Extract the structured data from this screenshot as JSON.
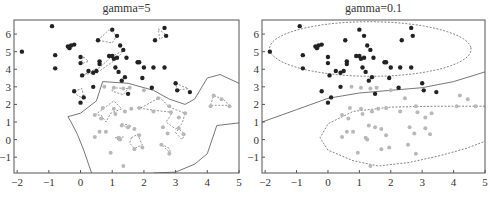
{
  "chart_data": [
    {
      "type": "scatter",
      "title": "gamma=5",
      "xlabel": "",
      "ylabel": "",
      "xlim": [
        -2.1,
        5
      ],
      "ylim": [
        -1.9,
        6.8
      ],
      "xticks": [
        "-2",
        "-1",
        "0",
        "1",
        "2",
        "3",
        "4",
        "5"
      ],
      "yticks": [
        "-1",
        "0",
        "1",
        "2",
        "3",
        "4",
        "5",
        "6"
      ],
      "grid": false,
      "series": [
        {
          "name": "class-dark",
          "color": "#222222",
          "points": [
            [
              -1.85,
              5.0
            ],
            [
              -0.9,
              6.45
            ],
            [
              -0.8,
              4.8
            ],
            [
              -0.8,
              4.05
            ],
            [
              -0.4,
              5.3
            ],
            [
              -0.35,
              5.2
            ],
            [
              -0.3,
              5.35
            ],
            [
              -0.2,
              5.4
            ],
            [
              0,
              4.7
            ],
            [
              0,
              4.35
            ],
            [
              0.05,
              3.65
            ],
            [
              0.25,
              3.9
            ],
            [
              0.4,
              3.8
            ],
            [
              0.5,
              3.9
            ],
            [
              0.55,
              5.65
            ],
            [
              0.6,
              4.45
            ],
            [
              0.6,
              4.3
            ],
            [
              0.9,
              4.75
            ],
            [
              1.0,
              6.25
            ],
            [
              1.0,
              4.75
            ],
            [
              1.05,
              4.6
            ],
            [
              1.1,
              4.1
            ],
            [
              1.15,
              5.9
            ],
            [
              1.15,
              4.65
            ],
            [
              1.2,
              3.85
            ],
            [
              1.25,
              5.35
            ],
            [
              1.3,
              3.35
            ],
            [
              1.35,
              5.1
            ],
            [
              1.4,
              3.55
            ],
            [
              1.45,
              4.65
            ],
            [
              1.5,
              2.6
            ],
            [
              1.8,
              4.4
            ],
            [
              1.85,
              4.4
            ],
            [
              1.95,
              3.5
            ],
            [
              2.0,
              4.1
            ],
            [
              2.25,
              2.95
            ],
            [
              2.3,
              4.1
            ],
            [
              2.35,
              5.65
            ],
            [
              2.65,
              6.35
            ],
            [
              2.7,
              5.9
            ],
            [
              2.65,
              4.1
            ],
            [
              3.0,
              3.2
            ],
            [
              3.05,
              2.8
            ],
            [
              3.45,
              2.7
            ],
            [
              -0.2,
              2.75
            ],
            [
              0,
              2.1
            ],
            [
              0.1,
              2.4
            ],
            [
              0.4,
              3.0
            ]
          ]
        },
        {
          "name": "class-light",
          "color": "#bbbbbb",
          "points": [
            [
              0.75,
              3.0
            ],
            [
              1.05,
              2.95
            ],
            [
              1.35,
              2.9
            ],
            [
              1.55,
              2.95
            ],
            [
              2.0,
              2.8
            ],
            [
              0.45,
              1.4
            ],
            [
              0.7,
              1.8
            ],
            [
              0.65,
              1.2
            ],
            [
              0.6,
              0.45
            ],
            [
              0.8,
              0.45
            ],
            [
              1.05,
              1.75
            ],
            [
              1.1,
              1.45
            ],
            [
              1.4,
              1.6
            ],
            [
              1.6,
              1.75
            ],
            [
              1.85,
              1.8
            ],
            [
              2.3,
              1.6
            ],
            [
              2.45,
              2.35
            ],
            [
              2.8,
              1.9
            ],
            [
              2.85,
              1.55
            ],
            [
              3.1,
              1.25
            ],
            [
              3.3,
              1.5
            ],
            [
              2.6,
              0.7
            ],
            [
              2.75,
              0.35
            ],
            [
              3.1,
              0.65
            ],
            [
              3.25,
              0.3
            ],
            [
              1.3,
              0.8
            ],
            [
              1.5,
              0.7
            ],
            [
              1.7,
              0.6
            ],
            [
              1.2,
              0.1
            ],
            [
              1.25,
              0.0
            ],
            [
              1.85,
              0.25
            ],
            [
              1.95,
              -0.45
            ],
            [
              1.7,
              -0.55
            ],
            [
              2.55,
              -0.3
            ],
            [
              2.8,
              -0.8
            ],
            [
              0.95,
              -0.75
            ],
            [
              1.35,
              -1.5
            ],
            [
              4.2,
              2.5
            ],
            [
              4.45,
              2.3
            ],
            [
              4.7,
              1.9
            ],
            [
              4.1,
              1.9
            ],
            [
              0.45,
              0.15
            ]
          ]
        }
      ],
      "annotations": [
        "decision boundary (solid)",
        "margin contours (dashed)"
      ]
    },
    {
      "type": "scatter",
      "title": "gamma=0.1",
      "xlabel": "",
      "ylabel": "",
      "xlim": [
        -2.1,
        5
      ],
      "ylim": [
        -1.9,
        6.8
      ],
      "xticks": [
        "-2",
        "-1",
        "0",
        "1",
        "2",
        "3",
        "4",
        "5"
      ],
      "yticks": [
        "-1",
        "0",
        "1",
        "2",
        "3",
        "4",
        "5",
        "6"
      ],
      "grid": false,
      "series": [
        {
          "name": "class-dark",
          "color": "#222222"
        },
        {
          "name": "class-light",
          "color": "#bbbbbb"
        }
      ],
      "annotations": [
        "decision boundary (solid)",
        "margin contours (dashed ellipses)"
      ]
    }
  ],
  "panels": {
    "left_title": "gamma=5",
    "right_title": "gamma=0.1"
  }
}
